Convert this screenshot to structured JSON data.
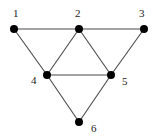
{
  "diagram": {
    "type": "graph",
    "directed": false,
    "nodes": [
      {
        "id": "1",
        "label": "1",
        "x": 14,
        "y": 29,
        "label_x": 13,
        "label_y": 17
      },
      {
        "id": "2",
        "label": "2",
        "x": 79,
        "y": 29,
        "label_x": 75,
        "label_y": 17
      },
      {
        "id": "3",
        "label": "3",
        "x": 144,
        "y": 29,
        "label_x": 139,
        "label_y": 17
      },
      {
        "id": "4",
        "label": "4",
        "x": 47,
        "y": 75,
        "label_x": 31,
        "label_y": 84
      },
      {
        "id": "5",
        "label": "5",
        "x": 111,
        "y": 75,
        "label_x": 122,
        "label_y": 85
      },
      {
        "id": "6",
        "label": "6",
        "x": 79,
        "y": 122,
        "label_x": 91,
        "label_y": 132
      }
    ],
    "edges": [
      {
        "from": "1",
        "to": "2"
      },
      {
        "from": "2",
        "to": "3"
      },
      {
        "from": "1",
        "to": "4"
      },
      {
        "from": "2",
        "to": "4"
      },
      {
        "from": "2",
        "to": "5"
      },
      {
        "from": "3",
        "to": "5"
      },
      {
        "from": "4",
        "to": "5"
      },
      {
        "from": "4",
        "to": "6"
      },
      {
        "from": "5",
        "to": "6"
      }
    ],
    "colors": {
      "node": "#000000",
      "edge": "#4a4a4a",
      "label": "#222222",
      "background": "#ffffff"
    },
    "node_radius": 4
  }
}
